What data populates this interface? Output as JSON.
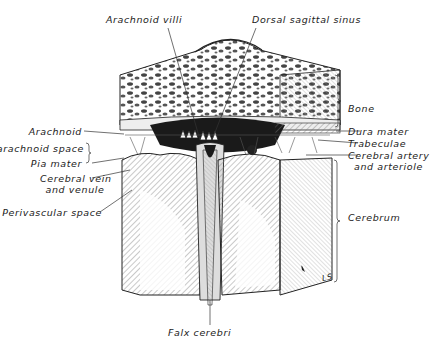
{
  "figure": {
    "signature": "LS",
    "labels": {
      "top": [
        {
          "id": "arachnoid-villi",
          "text": "Arachnoid  villi"
        },
        {
          "id": "dorsal-sagittal-sinus",
          "text": "Dorsal  sagittal  sinus"
        }
      ],
      "left": [
        {
          "id": "arachnoid",
          "text": "Arachnoid"
        },
        {
          "id": "subarachnoid-space",
          "text": "Subarachnoid  space"
        },
        {
          "id": "pia-mater",
          "text": "Pia  mater"
        },
        {
          "id": "cerebral-vein",
          "text": "Cerebral  vein"
        },
        {
          "id": "cerebral-vein-2",
          "text": "and  venule"
        },
        {
          "id": "perivascular-space",
          "text": "Perivascular  space"
        }
      ],
      "right": [
        {
          "id": "bone",
          "text": "Bone"
        },
        {
          "id": "dura-mater",
          "text": "Dura  mater"
        },
        {
          "id": "trabeculae",
          "text": "Trabeculae"
        },
        {
          "id": "cerebral-artery",
          "text": "Cerebral  artery"
        },
        {
          "id": "cerebral-artery-2",
          "text": "and  arteriole"
        },
        {
          "id": "cerebrum",
          "text": "Cerebrum"
        }
      ],
      "bottom": [
        {
          "id": "falx-cerebri",
          "text": "Falx  cerebri"
        }
      ]
    },
    "colors": {
      "ink": "#222222",
      "background": "#ffffff",
      "dark_fill": "#1a1a1a",
      "light_hatch": "#888888"
    }
  }
}
